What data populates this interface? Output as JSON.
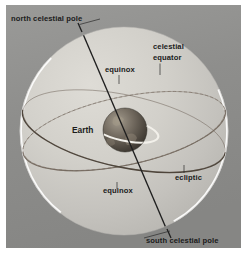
{
  "figure": {
    "background_color": "#8e8e8e",
    "sphere_color": "#c9c9c6",
    "frame_color": "#ffffff"
  },
  "labels": {
    "north_celestial_pole": "north celestial pole",
    "south_celestial_pole": "south celestial pole",
    "celestial_equator_line1": "celestial",
    "celestial_equator_line2": "equator",
    "equinox_upper": "equinox",
    "equinox_lower": "equinox",
    "ecliptic": "ecliptic",
    "earth": "Earth"
  },
  "colors": {
    "axis_line": "#252525",
    "celestial_equator_line": "#5d5248",
    "ecliptic_line": "#7d7168",
    "earth_dark": "#3a3530",
    "earth_light": "#8c8478",
    "rim_highlight": "#ffffff",
    "label_text": "#1b1b1b"
  },
  "geometry": {
    "celestial_sphere_center_x": 124,
    "celestial_sphere_center_y": 131,
    "celestial_sphere_radius": 104,
    "earth_center_x": 125,
    "earth_center_y": 130,
    "earth_radius": 22,
    "axis_tilt_degrees": 23.5
  }
}
